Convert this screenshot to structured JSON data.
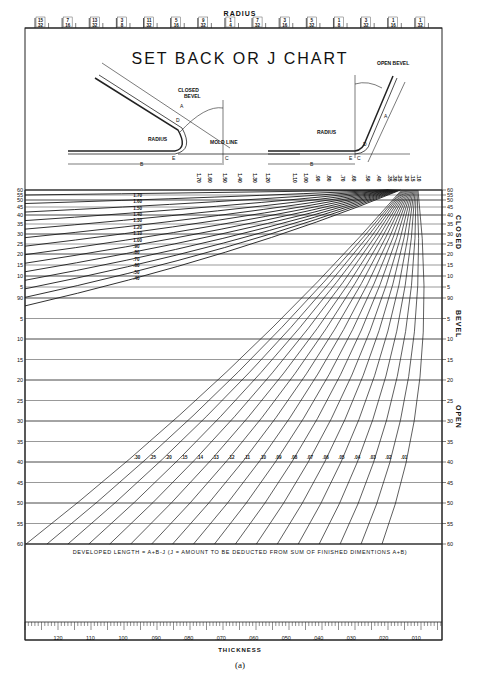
{
  "chart_data": {
    "type": "line",
    "title": "SET BACK OR J CHART",
    "title_underlined_word": "OR",
    "top_axis": {
      "label": "RADIUS",
      "ticks": [
        "15/32",
        "7/16",
        "13/32",
        "3/8",
        "11/32",
        "5/16",
        "9/32",
        "1/4",
        "7/32",
        "3/16",
        "5/32",
        "1/8",
        "3/32",
        "1/16",
        "1/32"
      ]
    },
    "bottom_axis": {
      "label": "THICKNESS",
      "ticks": [
        "120",
        "110",
        "100",
        ".090",
        ".080",
        ".070",
        ".060",
        ".050",
        ".040",
        ".030",
        ".020",
        ".010"
      ]
    },
    "left_axis_ticks": [
      "60",
      "55",
      "50",
      "45",
      "40",
      "35",
      "30",
      "25",
      "20",
      "15",
      "10",
      "5",
      "90",
      "5",
      "10",
      "15",
      "20",
      "25",
      "30",
      "35",
      "40",
      "45",
      "50",
      "55",
      "60"
    ],
    "right_axis_ticks": [
      "60",
      "55",
      "50",
      "45",
      "40",
      "35",
      "30",
      "25",
      "20",
      "15",
      "10",
      "5",
      "90",
      "5",
      "10",
      "15",
      "20",
      "25",
      "30",
      "35",
      "40",
      "45",
      "50",
      "55",
      "60"
    ],
    "right_axis_labels": {
      "upper": "CLOSED",
      "middle": "BEVEL",
      "lower": "OPEN"
    },
    "j_value_top_labels": [
      "1.70",
      "1.60",
      "1.50",
      "1.40",
      "1.30",
      "1.20",
      "1.10",
      "1.00",
      ".90",
      ".80",
      ".70",
      ".60",
      ".50",
      ".40",
      ".35",
      ".30",
      ".25",
      ".20",
      ".15",
      ".10"
    ],
    "curve_labels": [
      "1.70",
      "1.60",
      "1.50",
      "1.40",
      "1.30",
      "1.20",
      "1.10",
      "1.00",
      ".90",
      ".80",
      ".70",
      ".60",
      ".50",
      ".40",
      ".30",
      ".25",
      ".20",
      ".15",
      ".14",
      ".13",
      ".12",
      ".11",
      ".10",
      ".09",
      ".08",
      ".07",
      ".06",
      ".05",
      ".04",
      ".03",
      ".02",
      ".01"
    ],
    "note": "DEVELOPED LENGTH = A+B-J  (J = AMOUNT TO BE DEDUCTED FROM SUM OF FINISHED DIMENTIONS A+B)",
    "grid": true,
    "legend": "none"
  },
  "diagram": {
    "closed_bevel_label": "CLOSED BEVEL",
    "open_bevel_label": "OPEN BEVEL",
    "radius_label": "RADIUS",
    "mold_line_label": "MOLD LINE",
    "letters": [
      "A",
      "B",
      "C",
      "D",
      "E"
    ]
  },
  "caption": "(a)"
}
